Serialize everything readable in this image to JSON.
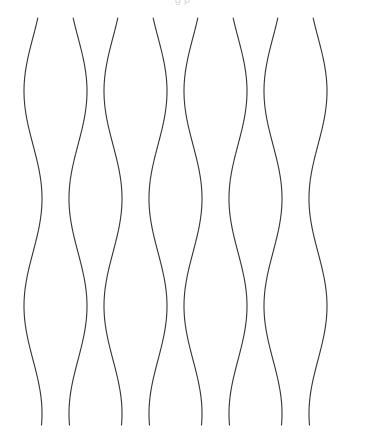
{
  "figure": {
    "title_fragment": "g p",
    "background_color": "#ffffff",
    "stroke_color": "#333333",
    "stroke_width": 1.1,
    "width": 365,
    "height": 435
  },
  "chart_data": {
    "type": "line",
    "title": "",
    "xlabel": "",
    "ylabel": "",
    "grid": false,
    "legend": "none",
    "xlim": [
      0,
      365
    ],
    "ylim": [
      18,
      425
    ],
    "y_samples": [
      18,
      69,
      120,
      171,
      222,
      235,
      273,
      324,
      375,
      425
    ],
    "curve_count": 8,
    "wave_period": 215,
    "wave_amplitude": 9,
    "series": [
      {
        "name": "curve-1",
        "center_x": 33,
        "phase": 0,
        "amplitude": 9,
        "x_values": [
          27,
          24.2,
          26.5,
          33.4,
          40.5,
          42.0,
          41.5,
          35.4,
          27.6,
          24.6
        ]
      },
      {
        "name": "curve-2",
        "center_x": 78,
        "phase": 3.14159,
        "amplitude": 9,
        "x_values": [
          72,
          73.6,
          85.3,
          87.0,
          80.3,
          72.9,
          70.0,
          70.9,
          78.7,
          86.9
        ]
      },
      {
        "name": "curve-3",
        "center_x": 113,
        "phase": 0,
        "amplitude": 9,
        "x_values": [
          107,
          104.2,
          106.5,
          113.4,
          120.5,
          122.0,
          121.5,
          115.4,
          107.6,
          104.6
        ]
      },
      {
        "name": "curve-4",
        "center_x": 158,
        "phase": 3.14159,
        "amplitude": 9,
        "x_values": [
          152,
          153.6,
          165.3,
          167.0,
          160.3,
          152.9,
          150.0,
          150.9,
          158.7,
          166.9
        ]
      },
      {
        "name": "curve-5",
        "center_x": 193,
        "phase": 0,
        "amplitude": 9,
        "x_values": [
          187,
          184.2,
          186.5,
          193.4,
          200.5,
          202.0,
          201.5,
          195.4,
          187.6,
          184.6
        ]
      },
      {
        "name": "curve-6",
        "center_x": 238,
        "phase": 3.14159,
        "amplitude": 9,
        "x_values": [
          232,
          233.6,
          245.3,
          247.0,
          240.3,
          232.9,
          230.0,
          230.9,
          238.7,
          246.9
        ]
      },
      {
        "name": "curve-7",
        "center_x": 273,
        "phase": 0,
        "amplitude": 9,
        "x_values": [
          267,
          264.2,
          266.5,
          273.4,
          280.5,
          282.0,
          281.5,
          275.4,
          267.6,
          264.6
        ]
      },
      {
        "name": "curve-8",
        "center_x": 318,
        "phase": 3.14159,
        "amplitude": 9,
        "x_values": [
          312,
          313.6,
          325.3,
          327.0,
          320.3,
          312.9,
          310.0,
          310.9,
          318.7,
          326.9
        ]
      }
    ]
  }
}
